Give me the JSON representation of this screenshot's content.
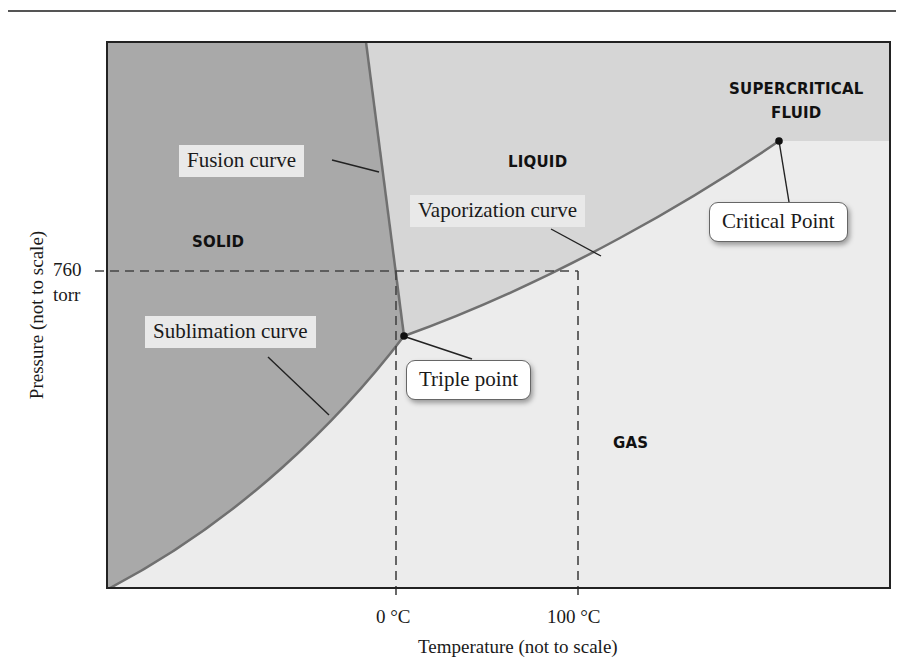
{
  "diagram": {
    "colors": {
      "solid_region": "#a9a9a9",
      "liquid_region": "#d6d6d6",
      "gas_region": "#ececec",
      "curve": "#707070",
      "frame": "#222222"
    },
    "phases": {
      "solid": "SOLID",
      "liquid": "LIQUID",
      "gas": "GAS",
      "supercritical_line1": "SUPERCRITICAL",
      "supercritical_line2": "FLUID"
    },
    "curve_labels": {
      "fusion": "Fusion curve",
      "vaporization": "Vaporization curve",
      "sublimation": "Sublimation curve"
    },
    "callouts": {
      "triple_point": "Triple point",
      "critical_point": "Critical Point"
    },
    "axes": {
      "x_label": "Temperature (not to scale)",
      "y_label": "Pressure (not to scale)",
      "x_ticks": [
        "0 °C",
        "100 °C"
      ],
      "y_tick_value": "760",
      "y_tick_unit": "torr"
    }
  }
}
